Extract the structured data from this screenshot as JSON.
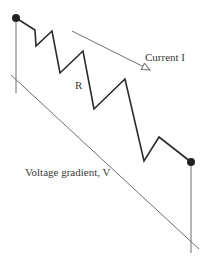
{
  "diagram": {
    "labels": {
      "resistance": "R",
      "current": "Current I",
      "voltage": "Voltage gradient, V"
    },
    "colors": {
      "wire": "#2a2a2a",
      "thin_line": "#6e6e6e",
      "node": "#222222",
      "background": "#ffffff"
    },
    "nodes": [
      {
        "name": "start-terminal",
        "x": 16,
        "y": 18
      },
      {
        "name": "end-terminal",
        "x": 191,
        "y": 162
      }
    ],
    "resistor_path": "16,18 35,30 36,46 52,31 60,73 83,51 94,109 125,79 144,161 159,137 191,162",
    "left_lead": {
      "x": 16,
      "y1": 18,
      "y2": 93
    },
    "right_lead": {
      "x": 191,
      "y1": 162,
      "y2": 253
    },
    "voltage_line": {
      "x1": 11,
      "y1": 75,
      "x2": 199,
      "y2": 249
    },
    "current_arrow": {
      "x1": 72,
      "y1": 31,
      "x2": 150,
      "y2": 70
    }
  }
}
